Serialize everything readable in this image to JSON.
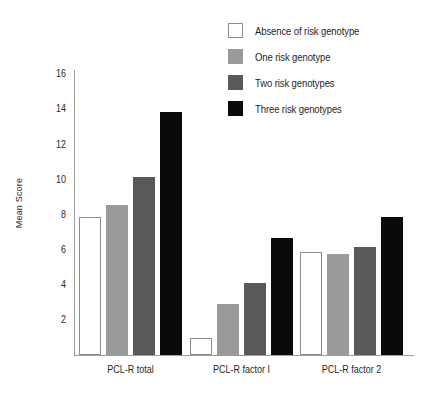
{
  "chart_data": {
    "type": "bar",
    "title": "",
    "xlabel": "",
    "ylabel": "Mean Score",
    "ylim": [
      0,
      16
    ],
    "yticks": [
      2,
      4,
      6,
      8,
      10,
      12,
      14,
      16
    ],
    "ytick_labels": [
      "2",
      "4",
      "6",
      "8",
      "10",
      "12",
      "14",
      "16"
    ],
    "grid": false,
    "legend_position": "top-right",
    "categories": [
      "PCL-R total",
      "PCL-R factor I",
      "PCL-R factor 2"
    ],
    "series": [
      {
        "name": "Absence of risk genotype",
        "color": "#ffffff",
        "border_color": "#8d8d8d",
        "values": [
          7.9,
          1.0,
          5.9
        ]
      },
      {
        "name": "One risk genotype",
        "color": "#9a9a9a",
        "border_color": "#9a9a9a",
        "values": [
          8.6,
          2.9,
          5.8
        ]
      },
      {
        "name": "Two risk genotypes",
        "color": "#595959",
        "border_color": "#595959",
        "values": [
          10.2,
          4.1,
          6.2
        ]
      },
      {
        "name": "Three risk genotypes",
        "color": "#0a0a0a",
        "border_color": "#0a0a0a",
        "values": [
          13.9,
          6.7,
          7.9
        ]
      }
    ]
  }
}
